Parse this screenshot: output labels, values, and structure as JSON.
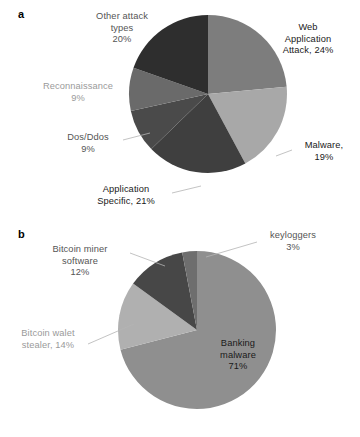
{
  "figure": {
    "background": "#ffffff",
    "panels": [
      {
        "letter": "a"
      },
      {
        "letter": "b"
      }
    ]
  },
  "chart_data": [
    {
      "type": "pie",
      "panel": "a",
      "title": "",
      "xlabel": "",
      "ylabel": "",
      "legend": "none",
      "labels_inline": true,
      "start_angle_deg": 0,
      "direction": "clockwise",
      "categories": [
        "Web Application Attack",
        "Malware",
        "Application Specific",
        "Dos/Ddos",
        "Reconnaissance",
        "Other attack types"
      ],
      "values": [
        24,
        19,
        21,
        9,
        9,
        20
      ],
      "units": "%",
      "colors": [
        "#7d7d7d",
        "#a8a8a8",
        "#3f3f3f",
        "#4a4a4a",
        "#6a6a6a",
        "#2e2e2e"
      ],
      "labels": [
        {
          "text": "Web\nApplication\nAttack, 24%",
          "tone": "dark",
          "align": "center"
        },
        {
          "text": "Malware,\n19%",
          "tone": "dark",
          "align": "center"
        },
        {
          "text": "Application\nSpecific, 21%",
          "tone": "dark",
          "align": "center"
        },
        {
          "text": "Dos/Ddos\n9%",
          "tone": "mid",
          "align": "center"
        },
        {
          "text": "Reconnaissance\n9%",
          "tone": "light",
          "align": "center"
        },
        {
          "text": "Other attack\ntypes\n20%",
          "tone": "mid",
          "align": "center"
        }
      ]
    },
    {
      "type": "pie",
      "panel": "b",
      "title": "",
      "xlabel": "",
      "ylabel": "",
      "legend": "none",
      "labels_inline": true,
      "start_angle_deg": 0,
      "direction": "clockwise",
      "categories": [
        "Banking malware",
        "Bitcoin walet stealer",
        "Bitcoin miner software",
        "keyloggers"
      ],
      "values": [
        71,
        14,
        12,
        3
      ],
      "units": "%",
      "colors": [
        "#8f8f8f",
        "#b0b0b0",
        "#474747",
        "#6e6e6e"
      ],
      "labels": [
        {
          "text": "Banking\nmalware\n71%",
          "tone": "dark",
          "align": "center"
        },
        {
          "text": "Bitcoin walet\nstealer, 14%",
          "tone": "light",
          "align": "center"
        },
        {
          "text": "Bitcoin miner\nsoftware\n12%",
          "tone": "mid",
          "align": "center"
        },
        {
          "text": "keyloggers\n3%",
          "tone": "mid",
          "align": "center"
        }
      ]
    }
  ]
}
